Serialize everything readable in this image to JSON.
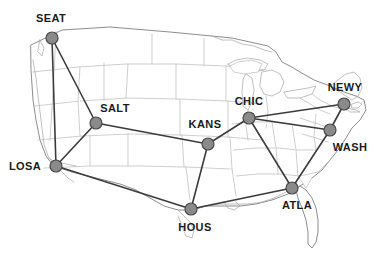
{
  "figure": {
    "width": 392,
    "height": 267,
    "background_color": "#ffffff"
  },
  "style": {
    "node_fill": "#8a8a8a",
    "node_stroke": "#4a4a4a",
    "node_radius": 6,
    "link_color": "#3b3b3b",
    "map_border_color": "#8d8d8d",
    "state_border_color": "#b9b9b9",
    "label_color": "#1a1a1a"
  },
  "chart_data": {
    "type": "diagram",
    "subtype": "network-graph-on-map",
    "basemap": "United States state boundaries",
    "nodes": [
      {
        "id": "SEAT",
        "label": "SEAT",
        "city": "Seattle",
        "x": 52,
        "y": 38,
        "label_x": 51,
        "label_y": 18,
        "label_pos": "above"
      },
      {
        "id": "SALT",
        "label": "SALT",
        "city": "Salt Lake City",
        "x": 96,
        "y": 123,
        "label_x": 115,
        "label_y": 108,
        "label_pos": "above-right"
      },
      {
        "id": "LOSA",
        "label": "LOSA",
        "city": "Los Angeles",
        "x": 56,
        "y": 166,
        "label_x": 25,
        "label_y": 166,
        "label_pos": "left"
      },
      {
        "id": "KANS",
        "label": "KANS",
        "city": "Kansas City",
        "x": 208,
        "y": 144,
        "label_x": 205,
        "label_y": 124,
        "label_pos": "above"
      },
      {
        "id": "CHIC",
        "label": "CHIC",
        "city": "Chicago",
        "x": 249,
        "y": 118,
        "label_x": 249,
        "label_y": 101,
        "label_pos": "above"
      },
      {
        "id": "HOUS",
        "label": "HOUS",
        "city": "Houston",
        "x": 191,
        "y": 209,
        "label_x": 195,
        "label_y": 227,
        "label_pos": "below"
      },
      {
        "id": "ATLA",
        "label": "ATLA",
        "city": "Atlanta",
        "x": 292,
        "y": 188,
        "label_x": 297,
        "label_y": 205,
        "label_pos": "below"
      },
      {
        "id": "WASH",
        "label": "WASH",
        "city": "Washington DC",
        "x": 330,
        "y": 130,
        "label_x": 350,
        "label_y": 147,
        "label_pos": "below-right"
      },
      {
        "id": "NEWY",
        "label": "NEWY",
        "city": "New York",
        "x": 344,
        "y": 104,
        "label_x": 345,
        "label_y": 87,
        "label_pos": "above"
      }
    ],
    "edges": [
      {
        "from": "SEAT",
        "to": "SALT"
      },
      {
        "from": "SEAT",
        "to": "LOSA"
      },
      {
        "from": "SALT",
        "to": "LOSA"
      },
      {
        "from": "SALT",
        "to": "KANS"
      },
      {
        "from": "LOSA",
        "to": "HOUS"
      },
      {
        "from": "KANS",
        "to": "CHIC"
      },
      {
        "from": "KANS",
        "to": "HOUS"
      },
      {
        "from": "CHIC",
        "to": "NEWY"
      },
      {
        "from": "CHIC",
        "to": "WASH"
      },
      {
        "from": "CHIC",
        "to": "ATLA"
      },
      {
        "from": "HOUS",
        "to": "ATLA"
      },
      {
        "from": "ATLA",
        "to": "WASH"
      },
      {
        "from": "NEWY",
        "to": "WASH"
      }
    ],
    "node_count": 9,
    "edge_count": 13,
    "legend": null,
    "annotations": []
  }
}
